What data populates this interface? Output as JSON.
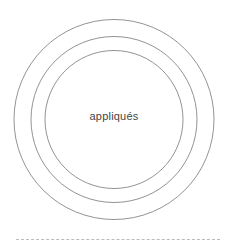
{
  "diagram": {
    "type": "concentric-circles",
    "center_label": "appliqués",
    "rings": 3,
    "stroke_color": "#777777",
    "divider_color": "#bbbbbb"
  }
}
